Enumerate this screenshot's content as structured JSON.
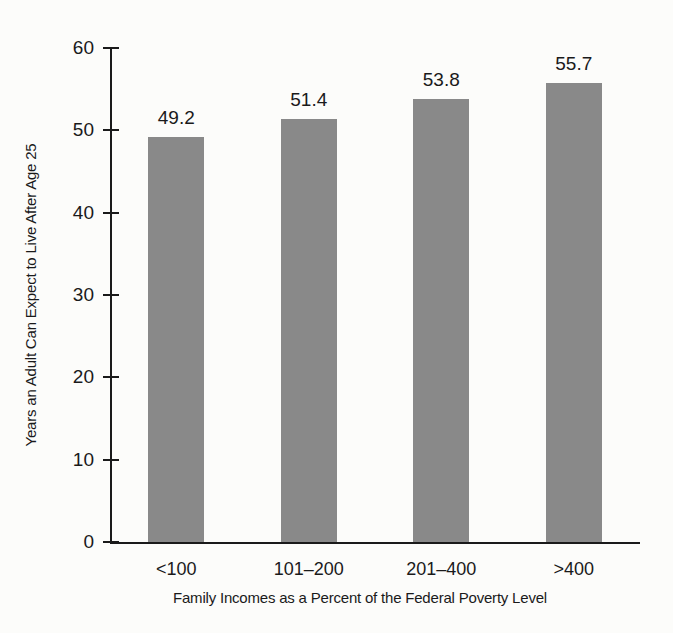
{
  "chart_data": {
    "type": "bar",
    "title": "",
    "subtitle": "",
    "xlabel": "Family Incomes as a Percent of the Federal Poverty Level",
    "ylabel": "Years an Adult Can Expect to Live After Age 25",
    "categories": [
      "<100",
      "101–200",
      "201–400",
      ">400"
    ],
    "values": [
      49.2,
      51.4,
      53.8,
      55.7
    ],
    "value_labels": [
      "49.2",
      "51.4",
      "53.8",
      "55.7"
    ],
    "ylim": [
      0,
      60
    ],
    "yticks": [
      0,
      10,
      20,
      30,
      40,
      50,
      60
    ],
    "ytick_labels": [
      "0",
      "10",
      "20",
      "30",
      "40",
      "50",
      "60"
    ],
    "grid": false,
    "legend": false,
    "legend_position": "none",
    "bar_color": "#898989",
    "axis_color": "#1a1a1a",
    "background_color": "#fcfcfa"
  }
}
